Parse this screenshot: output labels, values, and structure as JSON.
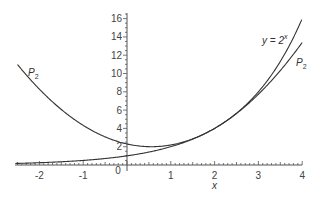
{
  "chart_data": {
    "type": "line",
    "title": "",
    "xlabel": "x",
    "ylabel": "",
    "xlim": [
      -2.5,
      4
    ],
    "ylim": [
      0,
      16.5
    ],
    "grid": false,
    "legend": "none (inline curve labels)",
    "x_ticks": [
      "-2",
      "-1",
      "0",
      "1",
      "2",
      "3",
      "4"
    ],
    "y_ticks": [
      "2",
      "4",
      "6",
      "8",
      "10",
      "12",
      "14",
      "16"
    ],
    "series": [
      {
        "name": "y = 2^x",
        "formula": "2^x",
        "x": [
          -2.5,
          -2,
          -1,
          0,
          1,
          2,
          3,
          4
        ],
        "values": [
          0.18,
          0.25,
          0.5,
          1,
          2,
          4,
          8,
          16
        ]
      },
      {
        "name": "P2",
        "formula": "4 + 4ln2(x-2) + 2(ln2)^2(x-2)^2",
        "x": [
          -2.5,
          -2,
          -1,
          0,
          0.5,
          1,
          2,
          3,
          4
        ],
        "values": [
          10.98,
          8.28,
          4.33,
          2.3,
          2.0,
          2.19,
          4,
          7.73,
          13.39
        ]
      }
    ],
    "annotations": [
      {
        "text": "y = 2^x",
        "near": [
          3.4,
          15
        ]
      },
      {
        "text": "P2",
        "near": [
          3.6,
          12.3
        ]
      },
      {
        "text": "P2",
        "near": [
          -2.1,
          10.5
        ]
      }
    ]
  },
  "labels": {
    "x_axis": "x",
    "exp_curve": "y = 2",
    "exp_sup": "x",
    "p2_main": "P",
    "p2_sub": "2",
    "zero": "0"
  }
}
